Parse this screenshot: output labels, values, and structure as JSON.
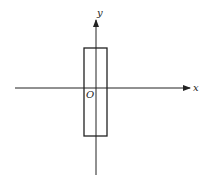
{
  "diagram": {
    "type": "coordinate-axes-with-rectangle",
    "axes": {
      "x_label": "x",
      "y_label": "y",
      "origin_label": "O"
    },
    "rectangle": {
      "description": "tall narrow rectangle straddling the y-axis, crossing the x-axis"
    },
    "colors": {
      "stroke": "#222222",
      "background": "#ffffff"
    }
  }
}
